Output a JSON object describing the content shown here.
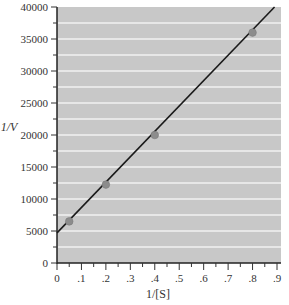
{
  "chart_data": {
    "type": "scatter",
    "title": "",
    "xlabel": "1/[S]",
    "ylabel": "1/V",
    "xlim": [
      0,
      0.9
    ],
    "ylim": [
      0,
      40000
    ],
    "x_ticks": [
      0,
      0.1,
      0.2,
      0.3,
      0.4,
      0.5,
      0.6,
      0.7,
      0.8,
      0.9
    ],
    "x_tick_labels": [
      "0",
      ".1",
      ".2",
      ".3",
      ".4",
      ".5",
      ".6",
      ".7",
      ".8",
      ".9"
    ],
    "y_ticks": [
      0,
      5000,
      10000,
      15000,
      20000,
      25000,
      30000,
      35000,
      40000
    ],
    "y_tick_labels": [
      "0",
      "5000",
      "10000",
      "15000",
      "20000",
      "25000",
      "30000",
      "35000",
      "40000"
    ],
    "grid": true,
    "grid_spacing_y": 2500,
    "legend": null,
    "series": [
      {
        "name": "data points",
        "kind": "scatter",
        "x": [
          0.05,
          0.2,
          0.4,
          0.8
        ],
        "y": [
          6500,
          12250,
          20000,
          36000
        ]
      },
      {
        "name": "fit line",
        "kind": "line",
        "x": [
          0,
          0.89
        ],
        "y": [
          4700,
          40000
        ]
      }
    ],
    "colors": {
      "plot_background": "#c8c8c8",
      "gridline": "#f2f2f2",
      "line": "#1a1a1a",
      "marker": "#8c8c8c"
    }
  }
}
